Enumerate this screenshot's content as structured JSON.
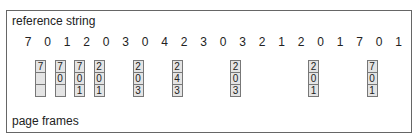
{
  "labels": {
    "reference_string": "reference string",
    "page_frames": "page frames"
  },
  "reference_string": [
    "7",
    "0",
    "1",
    "2",
    "0",
    "3",
    "0",
    "4",
    "2",
    "3",
    "0",
    "3",
    "2",
    "1",
    "2",
    "0",
    "1",
    "7",
    "0",
    "1"
  ],
  "frame_columns": [
    {
      "ref_index": 0,
      "frames": [
        "7",
        "",
        ""
      ]
    },
    {
      "ref_index": 1,
      "frames": [
        "7",
        "0",
        ""
      ]
    },
    {
      "ref_index": 2,
      "frames": [
        "7",
        "0",
        "1"
      ]
    },
    {
      "ref_index": 3,
      "frames": [
        "2",
        "0",
        "1"
      ]
    },
    {
      "ref_index": 5,
      "frames": [
        "2",
        "0",
        "3"
      ]
    },
    {
      "ref_index": 7,
      "frames": [
        "2",
        "4",
        "3"
      ]
    },
    {
      "ref_index": 10,
      "frames": [
        "2",
        "0",
        "3"
      ]
    },
    {
      "ref_index": 14,
      "frames": [
        "2",
        "0",
        "1"
      ]
    },
    {
      "ref_index": 17,
      "frames": [
        "7",
        "0",
        "1"
      ]
    }
  ]
}
